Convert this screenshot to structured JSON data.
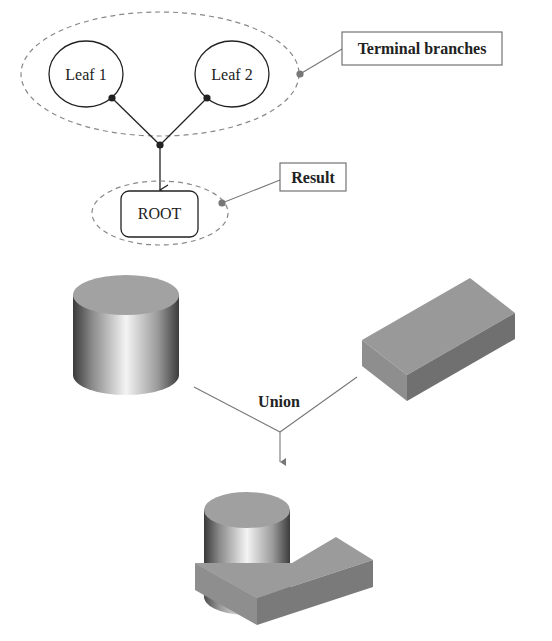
{
  "tree": {
    "leaves": [
      {
        "label": "Leaf 1"
      },
      {
        "label": "Leaf 2"
      }
    ],
    "root": {
      "label": "ROOT"
    },
    "callouts": {
      "terminal": "Terminal branches",
      "result": "Result"
    }
  },
  "operation": {
    "label": "Union"
  },
  "colors": {
    "stroke": "#222222",
    "dashed": "#888888",
    "callout_dot": "#777777",
    "box_top": "#9a9a9a",
    "box_front": "#8c8c8c",
    "box_side": "#6e6e6e",
    "cyl_top": "#a0a0a0"
  }
}
